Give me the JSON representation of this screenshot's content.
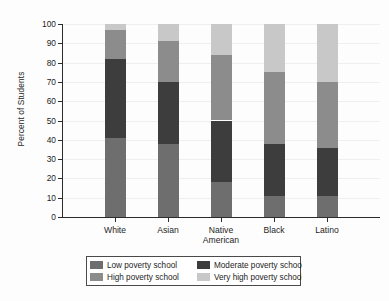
{
  "chart_data": {
    "type": "bar",
    "subtype": "stacked-bar-100",
    "title": "",
    "xlabel": "",
    "ylabel": "Percent of Students",
    "ylim": [
      0,
      100
    ],
    "ytick_values": [
      0,
      10,
      20,
      30,
      40,
      50,
      60,
      70,
      80,
      90,
      100
    ],
    "ytick_labels": [
      "0",
      "10",
      "20",
      "30",
      "40",
      "50",
      "60",
      "70",
      "80",
      "90",
      "100"
    ],
    "grid": true,
    "legend_position": "bottom",
    "categories": [
      "White",
      "Asian",
      "Native American",
      "Black",
      "Latino"
    ],
    "category_lines": [
      [
        "White"
      ],
      [
        "Asian"
      ],
      [
        "Native",
        "American"
      ],
      [
        "Black"
      ],
      [
        "Latino"
      ]
    ],
    "series": [
      {
        "name": "Low poverty school",
        "color": "#6e6e6e",
        "values": [
          41,
          38,
          18,
          11,
          11
        ],
        "cumulative_top": [
          41,
          38,
          18,
          11,
          11
        ]
      },
      {
        "name": "Moderate poverty school",
        "color": "#3d3d3d",
        "values": [
          41,
          32,
          32,
          27,
          25
        ],
        "cumulative_top": [
          82,
          70,
          50,
          38,
          36
        ]
      },
      {
        "name": "High poverty school",
        "color": "#8c8c8c",
        "values": [
          15,
          21,
          34,
          37,
          34
        ],
        "cumulative_top": [
          97,
          91,
          84,
          75,
          70
        ]
      },
      {
        "name": "Very high poverty school",
        "color": "#c8c8c8",
        "values": [
          3,
          9,
          16,
          25,
          30
        ],
        "cumulative_top": [
          100,
          100,
          100,
          100,
          100
        ]
      }
    ]
  },
  "legend": {
    "entries": [
      {
        "label": "Low poverty school",
        "color": "#6e6e6e"
      },
      {
        "label": "Moderate poverty school",
        "color": "#3d3d3d"
      },
      {
        "label": "High poverty school",
        "color": "#8c8c8c"
      },
      {
        "label": "Very high poverty school",
        "color": "#c8c8c8"
      }
    ]
  },
  "colors": {
    "axis": "#2b2b2b",
    "grid": "#efefef",
    "text": "#1d1d1d",
    "background": "#fdfdfd",
    "legend_border": "#4a4a4a"
  }
}
